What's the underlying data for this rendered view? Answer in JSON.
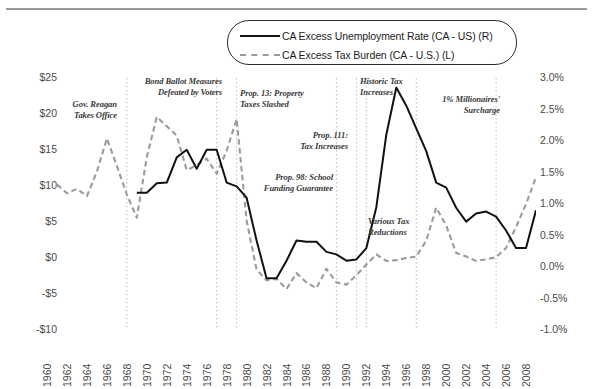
{
  "chart_data": {
    "type": "line",
    "title": "",
    "subtitle": "",
    "xlabel": "",
    "ylabel": "",
    "grid": false,
    "legend_position": "top-center",
    "x": [
      1960,
      1961,
      1962,
      1963,
      1964,
      1965,
      1966,
      1967,
      1968,
      1969,
      1970,
      1971,
      1972,
      1973,
      1974,
      1975,
      1976,
      1977,
      1978,
      1979,
      1980,
      1981,
      1982,
      1983,
      1984,
      1985,
      1986,
      1987,
      1988,
      1989,
      1990,
      1991,
      1992,
      1993,
      1994,
      1995,
      1996,
      1997,
      1998,
      1999,
      2000,
      2001,
      2002,
      2003,
      2004,
      2005,
      2006,
      2007,
      2008
    ],
    "xlim": [
      1960,
      2008
    ],
    "xticks": [
      1960,
      1962,
      1964,
      1966,
      1968,
      1970,
      1972,
      1974,
      1976,
      1978,
      1980,
      1982,
      1984,
      1986,
      1988,
      1990,
      1992,
      1994,
      1996,
      1998,
      2000,
      2002,
      2004,
      2006,
      2008
    ],
    "xticklabels": [
      "1960",
      "1962",
      "1964",
      "1966",
      "1968",
      "1970",
      "1972",
      "1974",
      "1976",
      "1978",
      "1980",
      "1982",
      "1984",
      "1986",
      "1988",
      "1990",
      "1992",
      "1994",
      "1996",
      "1998",
      "2000",
      "2002",
      "2004",
      "2006",
      "2008"
    ],
    "left_axis": {
      "label": "CA Excess Tax Burden (CA - U.S.) (L)",
      "ylim": [
        -10,
        25
      ],
      "ticks": [
        25,
        20,
        15,
        10,
        5,
        0,
        -5,
        -10
      ],
      "ticklabels": [
        "$25",
        "$20",
        "$15",
        "$10",
        "$5",
        "$0",
        "-$5",
        "-$10"
      ],
      "unit": "dollars"
    },
    "right_axis": {
      "label": "CA Excess Unemployment Rate (CA - US) (R)",
      "ylim": [
        -1.0,
        3.0
      ],
      "ticks": [
        3.0,
        2.5,
        2.0,
        1.5,
        1.0,
        0.5,
        0.0,
        -0.5,
        -1.0
      ],
      "ticklabels": [
        "3.0%",
        "2.5%",
        "2.0%",
        "1.5%",
        "1.0%",
        "0.5%",
        "0.0%",
        "-0.5%",
        "-1.0%"
      ],
      "unit": "percent"
    },
    "series": [
      {
        "name": "CA Excess Tax Burden (CA - U.S.) (L)",
        "axis": "left",
        "style": "dashed",
        "color": "#9b9b9b",
        "x": [
          1960,
          1961,
          1962,
          1963,
          1964,
          1965,
          1966,
          1967,
          1968,
          1969,
          1970,
          1971,
          1972,
          1973,
          1974,
          1975,
          1976,
          1977,
          1978,
          1979,
          1980,
          1981,
          1982,
          1983,
          1984,
          1985,
          1986,
          1987,
          1988,
          1989,
          1990,
          1991,
          1992,
          1993,
          1994,
          1995,
          1996,
          1997,
          1998,
          1999,
          2000,
          2001,
          2002,
          2003,
          2004,
          2005,
          2006,
          2007,
          2008
        ],
        "values": [
          10.2,
          9.0,
          9.6,
          8.6,
          12.0,
          16.6,
          12.8,
          8.8,
          5.6,
          14.0,
          19.6,
          18.3,
          17.0,
          12.2,
          12.9,
          13.8,
          11.7,
          14.9,
          19.3,
          5.2,
          -1.6,
          -3.1,
          -2.9,
          -4.3,
          -2.1,
          -3.4,
          -4.2,
          -1.5,
          -3.4,
          -3.7,
          -2.4,
          -0.9,
          0.5,
          -0.4,
          -0.3,
          0.0,
          0.2,
          2.4,
          7.0,
          4.5,
          0.7,
          0.2,
          -0.4,
          -0.2,
          0.1,
          1.4,
          4.3,
          7.5,
          11.2
        ]
      },
      {
        "name": "CA Excess Unemployment Rate (CA - US) (R)",
        "axis": "right",
        "style": "solid",
        "color": "#111111",
        "x": [
          1968,
          1969,
          1970,
          1971,
          1972,
          1973,
          1974,
          1975,
          1976,
          1977,
          1978,
          1979,
          1980,
          1981,
          1982,
          1983,
          1984,
          1985,
          1986,
          1987,
          1988,
          1989,
          1990,
          1991,
          1992,
          1993,
          1994,
          1995,
          1996,
          1997,
          1998,
          1999,
          2000,
          2001,
          2002,
          2003,
          2004,
          2005,
          2006,
          2007,
          2008
        ],
        "values": [
          1.18,
          1.18,
          1.33,
          1.34,
          1.74,
          1.86,
          1.56,
          1.86,
          1.86,
          1.34,
          1.28,
          1.1,
          0.42,
          -0.18,
          -0.18,
          0.1,
          0.42,
          0.4,
          0.4,
          0.24,
          0.2,
          0.1,
          0.12,
          0.3,
          0.95,
          2.1,
          2.85,
          2.56,
          2.2,
          1.84,
          1.34,
          1.26,
          0.94,
          0.72,
          0.85,
          0.88,
          0.8,
          0.58,
          0.3,
          0.3,
          0.9
        ]
      }
    ],
    "event_markers": [
      {
        "year": 1967,
        "label": "Gov. Reagan\nTakes Office"
      },
      {
        "year": 1976,
        "label": "Bond Ballot Measures\nDefeated by Voters"
      },
      {
        "year": 1978,
        "label": "Prop. 13: Property\nTaxes Slashed"
      },
      {
        "year": 1988,
        "label": "Prop. 98: School\nFunding Guarantee"
      },
      {
        "year": 1990,
        "label": "Prop. 111:\nTax Increases"
      },
      {
        "year": 1991,
        "label": "Historic Tax\nIncreases"
      },
      {
        "year": 1996,
        "label": "Various Tax\nReductions"
      },
      {
        "year": 2004,
        "label": "1% Millionaires'\nSurcharge"
      }
    ],
    "annotations": [
      {
        "name": "gov-reagan-takes-office",
        "line1": "Gov. Reagan",
        "line2": "Takes Office",
        "align": "right",
        "x": 117,
        "y": 99
      },
      {
        "name": "bond-ballot-measures-defeated",
        "line1": "Bond Ballot Measures",
        "line2": "Defeated by Voters",
        "align": "right",
        "x": 222,
        "y": 76
      },
      {
        "name": "prop-13-property-taxes-slashed",
        "line1": "Prop. 13: Property",
        "line2": "Taxes Slashed",
        "align": "left",
        "x": 240,
        "y": 88
      },
      {
        "name": "prop-111-tax-increases",
        "line1": "Prop. 111:",
        "line2": "Tax Increases",
        "align": "right",
        "x": 348,
        "y": 130
      },
      {
        "name": "prop-98-school-funding-guarantee",
        "line1": "Prop. 98: School",
        "line2": "Funding Guarantee",
        "align": "right",
        "x": 333,
        "y": 172
      },
      {
        "name": "historic-tax-increases",
        "line1": "Historic Tax",
        "line2": "Increases",
        "align": "left",
        "x": 360,
        "y": 76
      },
      {
        "name": "one-percent-millionaires-surcharge",
        "line1": "1% Millionaires'",
        "line2": "Surcharge",
        "align": "right",
        "x": 500,
        "y": 94
      },
      {
        "name": "various-tax-reductions",
        "line1": "Various Tax",
        "line2": "Reductions",
        "align": "left",
        "x": 368,
        "y": 216
      }
    ],
    "colors": {
      "unemployment_line": "#111111",
      "tax_burden_line": "#9b9b9b",
      "axis_text": "#4a4a4a",
      "annotation_text": "#3a3a3a",
      "marker_line": "#b8b8b8",
      "background": "#ffffff"
    }
  },
  "legend": {
    "items": [
      {
        "label": "CA Excess Unemployment Rate (CA - US) (R)",
        "style": "solid"
      },
      {
        "label": "CA Excess Tax Burden (CA - U.S.) (L)",
        "style": "dashed"
      }
    ]
  }
}
